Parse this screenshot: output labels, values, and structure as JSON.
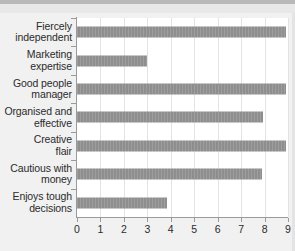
{
  "chart_data": {
    "type": "bar",
    "orientation": "horizontal",
    "title": "",
    "subtitle": "",
    "xlabel": "",
    "ylabel": "",
    "xlim": [
      0,
      9
    ],
    "ylim": null,
    "grid": "vertical",
    "legend": null,
    "bar_color": "#8e8e8e",
    "plot_background": "#ffffff",
    "figure_background": "#f1f1f1",
    "gridline_color": "#e3e3e3",
    "axis_color": "#9a9a9a",
    "xticks": [
      0,
      1,
      2,
      3,
      4,
      5,
      6,
      7,
      8,
      9
    ],
    "xtick_labels": [
      "0",
      "1",
      "2",
      "3",
      "4",
      "5",
      "6",
      "7",
      "8",
      "9"
    ],
    "categories": [
      "Fiercely independent",
      "Marketing expertise",
      "Good people manager",
      "Organised and effective",
      "Creative flair",
      "Cautious with money",
      "Enjoys tough decisions"
    ],
    "category_lines": [
      [
        "Fiercely",
        "independent"
      ],
      [
        "Marketing",
        "expertise"
      ],
      [
        "Good people",
        "manager"
      ],
      [
        "Organised and",
        "effective"
      ],
      [
        "Creative",
        "flair"
      ],
      [
        "Cautious with",
        "money"
      ],
      [
        "Enjoys tough",
        "decisions"
      ]
    ],
    "values": [
      8.9,
      3.0,
      8.9,
      7.95,
      8.9,
      7.9,
      3.85
    ]
  }
}
